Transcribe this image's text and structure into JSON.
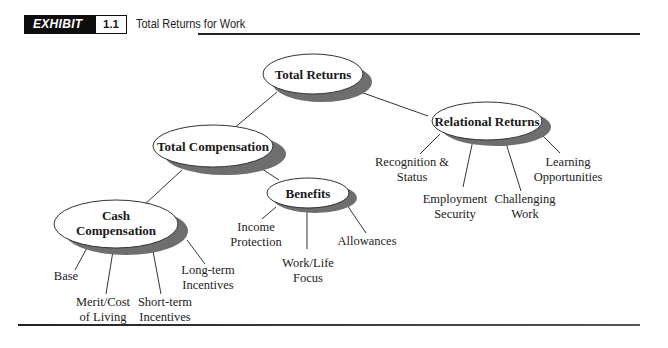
{
  "header": {
    "exhibit_label": "EXHIBIT",
    "exhibit_number": "1.1",
    "title": "Total Returns for Work"
  },
  "diagram": {
    "nodes": {
      "total_returns": "Total Returns",
      "total_compensation": "Total Compensation",
      "relational_returns": "Relational Returns",
      "benefits": "Benefits",
      "cash_compensation": "Cash\nCompensation"
    },
    "cash_leaves": {
      "base": "Base",
      "merit": "Merit/Cost\nof Living",
      "short_term": "Short-term\nIncentives",
      "long_term": "Long-term\nIncentives"
    },
    "benefit_leaves": {
      "income_protection": "Income\nProtection",
      "work_life": "Work/Life\nFocus",
      "allowances": "Allowances"
    },
    "relational_leaves": {
      "recognition": "Recognition &\nStatus",
      "employment_security": "Employment\nSecurity",
      "challenging_work": "Challenging\nWork",
      "learning": "Learning\nOpportunities"
    }
  }
}
